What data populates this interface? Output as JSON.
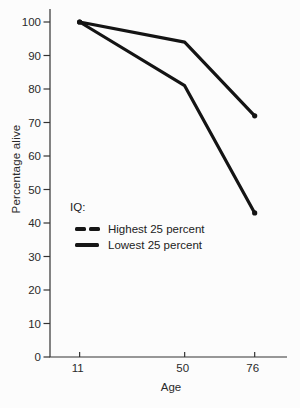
{
  "chart_data": {
    "type": "line",
    "title": "",
    "xlabel": "Age",
    "ylabel": "Percentage alive",
    "legend_title": "IQ:",
    "legend_position": "inside-middle-left",
    "grid": false,
    "line_color": "#141414",
    "text_color": "#2a2a2a",
    "background_color": "#fcfcfc",
    "xlim": [
      0,
      88
    ],
    "ylim": [
      0,
      100
    ],
    "x_ticks": [
      11,
      50,
      76
    ],
    "y_ticks": [
      0,
      10,
      20,
      30,
      40,
      50,
      60,
      70,
      80,
      90,
      100
    ],
    "series": [
      {
        "name": "Highest 25 percent",
        "marker_style": "broken-dash",
        "x": [
          11,
          50,
          76
        ],
        "values": [
          100,
          94,
          72
        ]
      },
      {
        "name": "Lowest 25 percent",
        "marker_style": "solid-dash",
        "x": [
          11,
          50,
          76
        ],
        "values": [
          100,
          81,
          43
        ]
      }
    ]
  }
}
